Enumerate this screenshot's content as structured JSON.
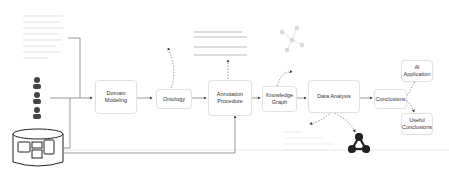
{
  "nodes": {
    "domain_modeling": "Domain Modeling",
    "ontology": "Ontology",
    "annotation_procedure": "Annotation Procedure",
    "knowledge_graph": "Knowledge Graph",
    "data_analysis": "Data Analysis",
    "conclusions": "Conclusions",
    "ai_application": "AI Application",
    "useful_conclusions": "Useful Conclusions"
  },
  "inputs": {
    "document_icon": "document-thumbnail",
    "person_icons": [
      "person-1",
      "person-2",
      "person-3"
    ],
    "database_icon": "multimedia-database"
  }
}
